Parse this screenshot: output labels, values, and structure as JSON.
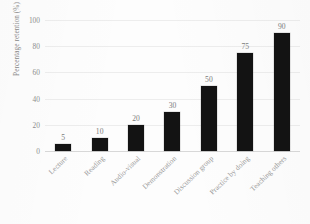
{
  "chart_data": {
    "type": "bar",
    "title": "",
    "xlabel": "",
    "ylabel": "Percentage retention (%)",
    "ylim": [
      0,
      100
    ],
    "grid": true,
    "legend": "none",
    "orientation": "vertical",
    "bar_color": "#131313",
    "categories": [
      "Lecture",
      "Reading",
      "Audio-visual",
      "Demonstration",
      "Discussion group",
      "Practice by doing",
      "Teaching others"
    ],
    "values": [
      5,
      10,
      20,
      30,
      50,
      75,
      90
    ],
    "value_labels": [
      "5",
      "10",
      "20",
      "30",
      "50",
      "75",
      "90"
    ],
    "yticks": [
      0,
      20,
      40,
      60,
      80,
      100
    ],
    "ytick_labels": [
      "0",
      "20",
      "40",
      "60",
      "80",
      "100"
    ]
  },
  "axes": {
    "y_title": "Percentage retention (%)"
  }
}
